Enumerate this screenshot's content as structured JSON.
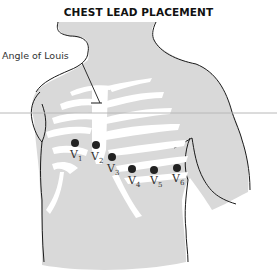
{
  "title": "CHEST LEAD PLACEMENT",
  "annotations": {
    "angle_of_louis": "Angle of Louis"
  },
  "leads": [
    {
      "name": "V",
      "sub": "1",
      "x": 75,
      "y": 143
    },
    {
      "name": "V",
      "sub": "2",
      "x": 96,
      "y": 145
    },
    {
      "name": "V",
      "sub": "3",
      "x": 112,
      "y": 157
    },
    {
      "name": "V",
      "sub": "4",
      "x": 132,
      "y": 169
    },
    {
      "name": "V",
      "sub": "5",
      "x": 154,
      "y": 170
    },
    {
      "name": "V",
      "sub": "6",
      "x": 177,
      "y": 168
    }
  ],
  "colors": {
    "body_fill": "#d9d9d9",
    "outline": "#1a1a1a",
    "ribs": "#ffffff",
    "electrode": "#222222",
    "guide_line": "#b8b8b8"
  }
}
